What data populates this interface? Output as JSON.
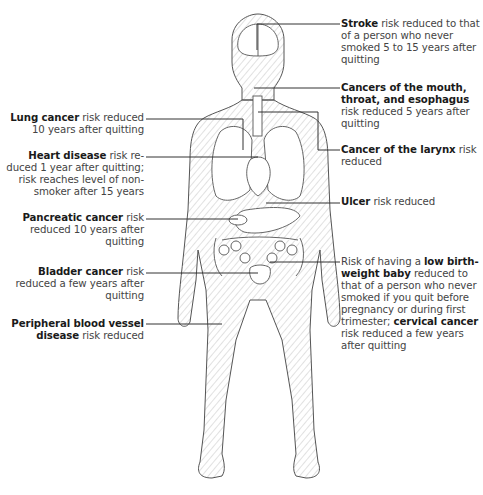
{
  "diagram": {
    "figure": "human-body-front-view",
    "left_labels": [
      {
        "id": "lung",
        "bold": "Lung cancer",
        "text": " risk reduced 10 years after quitting",
        "lines": [
          "Lung cancer risk reduced",
          "10 years after quitting"
        ]
      },
      {
        "id": "heart",
        "bold": "Heart disease",
        "text": " risk reduced 1 year after quitting; risk reaches level of nonsmoker after 15 years",
        "lines": [
          "Heart disease risk re-",
          "duced 1 year after quitting;",
          "risk reaches level of non-",
          "smoker after 15 years"
        ]
      },
      {
        "id": "pancreatic",
        "bold": "Pancreatic cancer",
        "text": " risk reduced 10 years after quitting",
        "lines": [
          "Pancreatic cancer risk",
          "reduced 10 years after",
          "quitting"
        ]
      },
      {
        "id": "bladder",
        "bold": "Bladder cancer",
        "text": " risk reduced a few years after quitting",
        "lines": [
          "Bladder cancer risk",
          "reduced a few years after",
          "quitting"
        ]
      },
      {
        "id": "peripheral",
        "bold": "Peripheral blood vessel disease",
        "text": " risk reduced",
        "lines": [
          "Peripheral blood vessel",
          "disease risk reduced"
        ]
      }
    ],
    "right_labels": [
      {
        "id": "stroke",
        "bold": "Stroke",
        "text": " risk reduced to that of a person who never smoked 5 to 15 years after quitting",
        "lines": [
          "Stroke risk reduced to that",
          "of a person who never",
          "smoked 5 to 15 years after",
          "quitting"
        ]
      },
      {
        "id": "mouth",
        "bold": "Cancers of the mouth, throat, and esophagus",
        "text": " risk reduced 5 years after quitting",
        "lines": [
          "Cancers of the mouth,",
          "throat, and esophagus",
          "risk reduced 5 years after",
          "quitting"
        ]
      },
      {
        "id": "larynx",
        "bold": "Cancer of the larynx",
        "text": " risk reduced",
        "lines": [
          "Cancer of the larynx risk",
          "reduced"
        ]
      },
      {
        "id": "ulcer",
        "bold": "Ulcer",
        "text": " risk reduced",
        "lines": [
          "Ulcer risk reduced"
        ]
      },
      {
        "id": "birthweight",
        "bold": "low birth-weight baby; cervical cancer",
        "text": "Risk of having a low birth-weight baby reduced to that of a person who never smoked if you quit before pregnancy or during first trimester; cervical cancer risk reduced a few years after quitting",
        "lines": [
          "Risk of having a low birth-",
          "weight baby reduced to",
          "that of a person who never",
          "smoked if you quit before",
          "pregnancy or during first",
          "trimester; cervical cancer",
          "risk reduced a few years",
          "after quitting"
        ]
      }
    ],
    "colors": {
      "line": "#333333",
      "body_outline": "#555555",
      "shading": "#bbbbbb",
      "text_bold": "#1a1a1a",
      "text": "#444444"
    }
  }
}
